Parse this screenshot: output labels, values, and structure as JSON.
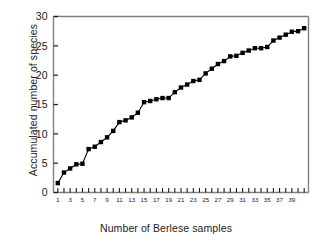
{
  "chart_data": {
    "type": "line",
    "title": "",
    "xlabel": "Number of Berlese samples",
    "ylabel": "Accumulated number of species",
    "xlim": [
      0.3,
      41.7
    ],
    "ylim": [
      0,
      30
    ],
    "grid": false,
    "legend": null,
    "marker": "filled-square",
    "line_color": "#000000",
    "marker_color": "#000000",
    "axis_color": "#808080",
    "y_ticks": [
      0,
      5,
      10,
      15,
      20,
      25,
      30
    ],
    "y_tick_labels": [
      "0",
      "5",
      "10",
      "15",
      "20",
      "25",
      "30"
    ],
    "x_ticks": [
      1,
      2,
      3,
      4,
      5,
      6,
      7,
      8,
      9,
      10,
      11,
      12,
      13,
      14,
      15,
      16,
      17,
      18,
      19,
      20,
      21,
      22,
      23,
      24,
      25,
      26,
      27,
      28,
      29,
      30,
      31,
      32,
      33,
      34,
      35,
      36,
      37,
      38,
      39,
      40,
      41
    ],
    "x_tick_labels": [
      "1",
      "",
      "3",
      "",
      "5",
      "",
      "7",
      "",
      "9",
      "",
      "11",
      "",
      "13",
      "",
      "15",
      "",
      "17",
      "",
      "19",
      "",
      "21",
      "",
      "23",
      "",
      "25",
      "",
      "27",
      "",
      "29",
      "",
      "31",
      "",
      "33",
      "",
      "35",
      "",
      "37",
      "",
      "39",
      "",
      ""
    ],
    "x": [
      1,
      2,
      3,
      4,
      5,
      6,
      7,
      8,
      9,
      10,
      11,
      12,
      13,
      14,
      15,
      16,
      17,
      18,
      19,
      20,
      21,
      22,
      23,
      24,
      25,
      26,
      27,
      28,
      29,
      30,
      31,
      32,
      33,
      34,
      35,
      36,
      37,
      38,
      39,
      40,
      41
    ],
    "y": [
      1.6,
      3.4,
      4.1,
      4.8,
      4.9,
      7.4,
      7.8,
      8.6,
      9.4,
      10.5,
      12.0,
      12.3,
      12.8,
      13.6,
      15.4,
      15.6,
      15.9,
      16.1,
      16.1,
      17.1,
      17.9,
      18.4,
      19.0,
      19.2,
      20.3,
      21.1,
      21.9,
      22.4,
      23.2,
      23.3,
      23.8,
      24.2,
      24.6,
      24.6,
      24.8,
      25.9,
      26.4,
      26.9,
      27.4,
      27.5,
      28.0
    ]
  }
}
